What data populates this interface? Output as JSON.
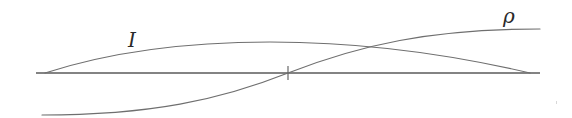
{
  "diagram": {
    "labels": {
      "intensity": "I",
      "density": "ρ"
    },
    "colors": {
      "curve": "#6f6f6f",
      "axis": "#5a5a5a",
      "label": "#2a2a2a",
      "background": "#ffffff"
    },
    "axis": {
      "x_start": 36,
      "x_end": 540,
      "y": 73,
      "midpoint_tick_x": 288
    },
    "curves": [
      {
        "name": "I",
        "shape": "arch",
        "start": [
          45,
          73
        ],
        "peak": [
          270,
          42
        ],
        "end": [
          530,
          73
        ]
      },
      {
        "name": "ρ",
        "shape": "sigmoid",
        "start": [
          42,
          115
        ],
        "center": [
          288,
          73
        ],
        "end": [
          540,
          29
        ]
      }
    ],
    "intersection_point": [
      372,
      47
    ]
  }
}
